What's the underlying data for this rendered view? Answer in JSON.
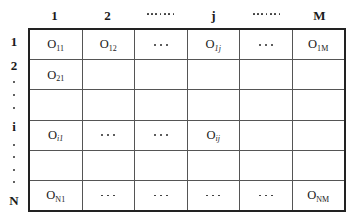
{
  "figure": {
    "kind": "matrix-grid"
  },
  "column_headers": [
    {
      "type": "text",
      "label": "1"
    },
    {
      "type": "text",
      "label": "2"
    },
    {
      "type": "dots",
      "label": ". . . . . . .",
      "count": 7
    },
    {
      "type": "text",
      "label": "j"
    },
    {
      "type": "dots",
      "label": ". . . . . . .",
      "count": 7
    },
    {
      "type": "text",
      "label": "M"
    }
  ],
  "row_labels": [
    {
      "type": "text",
      "label": "1"
    },
    {
      "type": "text",
      "label": "2"
    },
    {
      "type": "dot",
      "label": "."
    },
    {
      "type": "dot",
      "label": "."
    },
    {
      "type": "dot",
      "label": "."
    },
    {
      "type": "text",
      "label": "i"
    },
    {
      "type": "dot",
      "label": "."
    },
    {
      "type": "dot",
      "label": "."
    },
    {
      "type": "dot",
      "label": "."
    },
    {
      "type": "dot",
      "label": "."
    },
    {
      "type": "text",
      "label": "N"
    }
  ],
  "rows": [
    {
      "name": "row-1",
      "cells": [
        {
          "type": "symbol",
          "base": "O",
          "sub": "11",
          "italic_sub": false,
          "text": "O11"
        },
        {
          "type": "symbol",
          "base": "O",
          "sub": "12",
          "italic_sub": false,
          "text": "O12"
        },
        {
          "type": "dots",
          "text": ". . ."
        },
        {
          "type": "symbol",
          "base": "O",
          "sub": "1j",
          "italic_sub": true,
          "text": "O1j"
        },
        {
          "type": "dots",
          "text": ". . ."
        },
        {
          "type": "symbol",
          "base": "O",
          "sub": "1M",
          "italic_sub": false,
          "text": "O1M"
        }
      ]
    },
    {
      "name": "row-2",
      "cells": [
        {
          "type": "symbol",
          "base": "O",
          "sub": "21",
          "italic_sub": false,
          "text": "O21"
        },
        {
          "type": "empty",
          "text": ""
        },
        {
          "type": "empty",
          "text": ""
        },
        {
          "type": "empty",
          "text": ""
        },
        {
          "type": "empty",
          "text": ""
        },
        {
          "type": "empty",
          "text": ""
        }
      ]
    },
    {
      "name": "row-gap-upper",
      "cells": [
        {
          "type": "empty",
          "text": ""
        },
        {
          "type": "empty",
          "text": ""
        },
        {
          "type": "empty",
          "text": ""
        },
        {
          "type": "empty",
          "text": ""
        },
        {
          "type": "empty",
          "text": ""
        },
        {
          "type": "empty",
          "text": ""
        }
      ]
    },
    {
      "name": "row-i",
      "cells": [
        {
          "type": "symbol",
          "base": "O",
          "sub": "i1",
          "italic_sub": true,
          "text": "Oi1"
        },
        {
          "type": "dots",
          "text": ". . ."
        },
        {
          "type": "dots",
          "text": ". . ."
        },
        {
          "type": "symbol",
          "base": "O",
          "sub": "ij",
          "italic_sub": true,
          "text": "Oij"
        },
        {
          "type": "empty",
          "text": ""
        },
        {
          "type": "empty",
          "text": ""
        }
      ]
    },
    {
      "name": "row-gap-lower",
      "cells": [
        {
          "type": "empty",
          "text": ""
        },
        {
          "type": "empty",
          "text": ""
        },
        {
          "type": "empty",
          "text": ""
        },
        {
          "type": "empty",
          "text": ""
        },
        {
          "type": "empty",
          "text": ""
        },
        {
          "type": "empty",
          "text": ""
        }
      ]
    },
    {
      "name": "row-N",
      "cells": [
        {
          "type": "symbol",
          "base": "O",
          "sub": "N1",
          "italic_sub": false,
          "text": "ON1"
        },
        {
          "type": "dots",
          "text": ". . ."
        },
        {
          "type": "dots",
          "text": ". . ."
        },
        {
          "type": "dots",
          "text": ". . ."
        },
        {
          "type": "dots",
          "text": ". . ."
        },
        {
          "type": "symbol",
          "base": "O",
          "sub": "NM",
          "italic_sub": false,
          "text": "ONM"
        }
      ]
    }
  ],
  "colors": {
    "border_outer": "#222222",
    "border_inner": "#555555",
    "text": "#1a1a1a",
    "background": "#ffffff"
  }
}
